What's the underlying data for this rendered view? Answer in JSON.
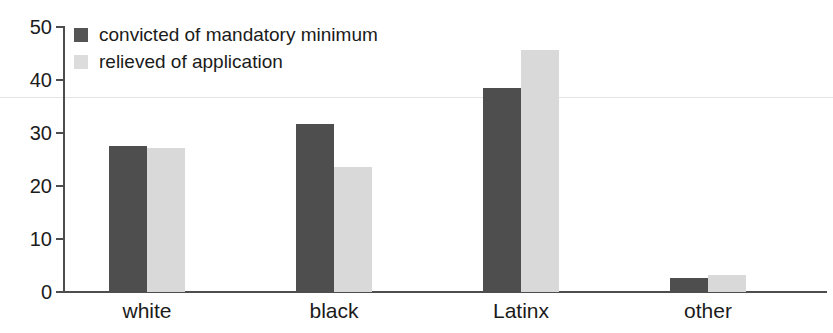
{
  "chart_data": {
    "type": "bar",
    "title": "",
    "subtitle": "",
    "xlabel": "",
    "ylabel": "",
    "categories": [
      "white",
      "black",
      "Latinx",
      "other"
    ],
    "series": [
      {
        "name": "convicted of mandatory minimum",
        "color": "#4e4e4e",
        "values": [
          27.5,
          31.7,
          38.5,
          2.7
        ]
      },
      {
        "name": "relieved of application",
        "color": "#d9d9d9",
        "values": [
          27.2,
          23.6,
          45.7,
          3.3
        ]
      }
    ],
    "ylim": [
      0,
      50
    ],
    "yticks": [
      0,
      10,
      20,
      30,
      40,
      50
    ],
    "ytick_labels": [
      "0",
      "10",
      "20",
      "30",
      "40",
      "50"
    ],
    "grid": false,
    "legend_position": "top-left"
  },
  "legend": {
    "items": [
      {
        "label": "convicted of mandatory minimum",
        "swatch": "dark"
      },
      {
        "label": "relieved of application",
        "swatch": "light"
      }
    ]
  }
}
